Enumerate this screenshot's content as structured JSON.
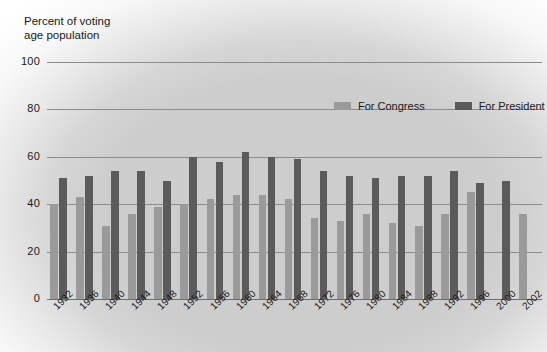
{
  "chart_data": {
    "type": "bar",
    "title": "",
    "ylabel": "Percent of voting\nage population",
    "xlabel": "",
    "ylim": [
      0,
      100
    ],
    "yticks": [
      0,
      20,
      40,
      60,
      80,
      100
    ],
    "grid": true,
    "legend_position": "top-right",
    "categories": [
      "1932",
      "1936",
      "1940",
      "1944",
      "1948",
      "1952",
      "1956",
      "1960",
      "1964",
      "1968",
      "1972",
      "1976",
      "1980",
      "1984",
      "1988",
      "1992",
      "1996",
      "2000",
      "2002"
    ],
    "series": [
      {
        "name": "For Congress",
        "color": "#9a9a9a",
        "values": [
          40,
          43,
          31,
          36,
          39,
          40,
          42,
          44,
          44,
          42,
          34,
          33,
          36,
          32,
          31,
          36,
          45,
          null,
          36
        ]
      },
      {
        "name": "For President",
        "color": "#5b5b5b",
        "values": [
          51,
          52,
          54,
          54,
          50,
          60,
          58,
          62,
          60,
          59,
          54,
          52,
          51,
          52,
          52,
          54,
          49,
          50,
          null
        ]
      }
    ]
  },
  "axis": {
    "y_title_line1": "Percent of voting",
    "y_title_line2": "age population",
    "y_tick_labels": [
      "100",
      "80",
      "60",
      "40",
      "20",
      "0"
    ],
    "x_tick_labels": [
      "1932",
      "1936",
      "1940",
      "1944",
      "1948",
      "1952",
      "1956",
      "1960",
      "1964",
      "1968",
      "1972",
      "1976",
      "1980",
      "1984",
      "1988",
      "1992",
      "1996",
      "2000",
      "2002"
    ]
  },
  "legend": {
    "items": [
      {
        "label": "For Congress",
        "color": "#9a9a9a"
      },
      {
        "label": "For President",
        "color": "#5b5b5b"
      }
    ]
  },
  "colors": {
    "congress": "#9a9a9a",
    "president": "#5b5b5b",
    "plot_background": "#cdcdcd",
    "gridline": "#8c8c8c",
    "text": "#1a1a1a"
  }
}
